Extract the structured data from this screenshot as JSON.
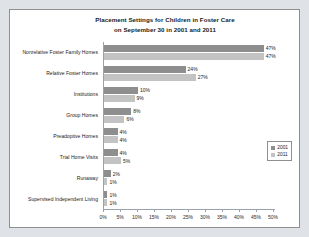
{
  "chart_data": {
    "type": "bar",
    "title": "Placement Settings for Children in Foster Care on September 30 in 2001 and 2011",
    "title_line1": "Placement Settings for Children in Foster Care",
    "title_line2": "on September 30 in 2001 and 2011",
    "orientation": "horizontal",
    "xlabel": "",
    "ylabel": "",
    "xlim": [
      0,
      50
    ],
    "xticks": [
      "0%",
      "5%",
      "10%",
      "15%",
      "20%",
      "25%",
      "30%",
      "35%",
      "40%",
      "45%",
      "50%"
    ],
    "xtick_values": [
      0,
      5,
      10,
      15,
      20,
      25,
      30,
      35,
      40,
      45,
      50
    ],
    "grid": false,
    "legend_position": "bottom-right",
    "categories": [
      "Nonrelative Foster Family Homes",
      "Relative Foster Homes",
      "Institutions",
      "Group Homes",
      "Preadoptive Homes",
      "Trial Home Visits",
      "Runaway",
      "Supervised Independent Living"
    ],
    "series": [
      {
        "name": "2001",
        "color": "#8e8e8e",
        "values": [
          47,
          24,
          10,
          8,
          4,
          4,
          2,
          1
        ],
        "labels": [
          "47%",
          "24%",
          "10%",
          "8%",
          "4%",
          "4%",
          "2%",
          "1%"
        ]
      },
      {
        "name": "2011",
        "color": "#c3c3c3",
        "values": [
          47,
          27,
          9,
          6,
          4,
          5,
          1,
          1
        ],
        "labels": [
          "47%",
          "27%",
          "9%",
          "6%",
          "4%",
          "5%",
          "1%",
          "1%"
        ]
      }
    ]
  },
  "colors": {
    "page_background": "#dfe3e8",
    "card_background": "#ffffff",
    "card_border": "#8f8f8f",
    "axis": "#9aa3ad",
    "text": "#1b1b1b"
  }
}
